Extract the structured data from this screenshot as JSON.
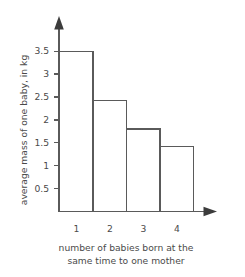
{
  "chart_data": {
    "type": "bar",
    "title": "",
    "categories": [
      "1",
      "2",
      "3",
      "4"
    ],
    "values": [
      3.5,
      2.42,
      1.8,
      1.42
    ],
    "xlabel_lines": [
      "number of babies born at the",
      "same time to one mother"
    ],
    "xlabel": "number of babies born at the same time to one mother",
    "ylabel": "average mass of one baby, in kg",
    "yticks": [
      "0.5",
      "1",
      "1.5",
      "2",
      "2.5",
      "3",
      "3.5"
    ],
    "ytick_values": [
      0.5,
      1,
      1.5,
      2,
      2.5,
      3,
      3.5
    ],
    "ylim": [
      0,
      3.85
    ],
    "grid": false,
    "legend": null,
    "bar_fill": "#ffffff",
    "bar_stroke": "#5a5a5a",
    "axis_color": "#5a5a5a",
    "text_color": "#4a4a4a",
    "background": "#ffffff",
    "x_axis_has_arrow": true,
    "y_axis_has_arrow": true
  },
  "ytick_labels": {
    "t0": "0.5",
    "t1": "1",
    "t2": "1.5",
    "t3": "2",
    "t4": "2.5",
    "t5": "3",
    "t6": "3.5"
  },
  "xtick_labels": {
    "c0": "1",
    "c1": "2",
    "c2": "3",
    "c3": "4"
  },
  "labels": {
    "y_axis_title": "average mass of one baby, in kg",
    "x_caption_line1": "number of babies born at the",
    "x_caption_line2": "same time to one mother"
  }
}
